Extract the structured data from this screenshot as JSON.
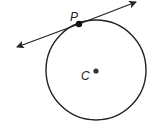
{
  "diagram": {
    "points": {
      "tangent_point_label": "P",
      "center_label": "C"
    },
    "elements": [
      "circle",
      "tangent-line-with-arrows",
      "point-P",
      "center-point-C"
    ],
    "colors": {
      "stroke": "#222222",
      "background": "#ffffff"
    }
  }
}
